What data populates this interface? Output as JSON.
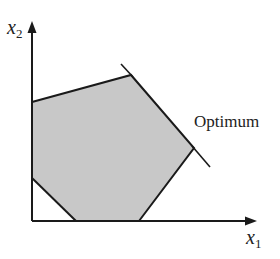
{
  "diagram": {
    "type": "linear-programming-feasible-region",
    "axes": {
      "x_label": "x",
      "x_sub": "1",
      "y_label": "x",
      "y_sub": "2"
    },
    "annotation": "Optimum",
    "colors": {
      "region_fill": "#c8c8c8",
      "line": "#1a1a1a",
      "background": "#ffffff"
    },
    "polygon_vertices": [
      [
        32,
        102
      ],
      [
        131,
        75
      ],
      [
        194,
        148
      ],
      [
        139,
        221
      ],
      [
        76,
        221
      ],
      [
        32,
        178
      ]
    ],
    "objective_lines": [
      {
        "from": [
          121,
          64
        ],
        "to": [
          131,
          75
        ]
      },
      {
        "from": [
          194,
          148
        ],
        "to": [
          210,
          167
        ]
      }
    ]
  }
}
